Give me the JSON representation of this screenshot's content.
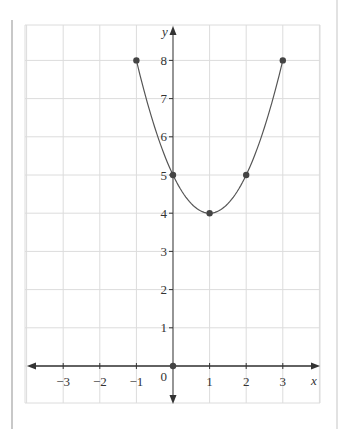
{
  "chart_data": {
    "type": "line",
    "title": "",
    "xlabel": "x",
    "ylabel": "y",
    "xlim": [
      -4,
      4
    ],
    "ylim": [
      -1,
      9
    ],
    "grid": true,
    "x_ticks": [
      -3,
      -2,
      -1,
      1,
      2,
      3
    ],
    "x_tick_labels": [
      "−3",
      "−2",
      "−1",
      "1",
      "2",
      "3"
    ],
    "y_ticks": [
      1,
      2,
      3,
      4,
      5,
      6,
      7,
      8
    ],
    "y_tick_labels": [
      "1",
      "2",
      "3",
      "4",
      "5",
      "6",
      "7",
      "8"
    ],
    "origin_label": "0",
    "series": [
      {
        "name": "y = x² − 2x + 5",
        "kind": "curve",
        "x_range": [
          -1,
          3
        ],
        "x": [
          -1,
          0,
          1,
          2,
          3
        ],
        "y": [
          8,
          5,
          4,
          5,
          8
        ]
      }
    ],
    "points": [
      {
        "x": -1,
        "y": 8
      },
      {
        "x": 0,
        "y": 5
      },
      {
        "x": 1,
        "y": 4
      },
      {
        "x": 2,
        "y": 5
      },
      {
        "x": 3,
        "y": 8
      },
      {
        "x": 0,
        "y": 0
      }
    ],
    "colors": {
      "grid": "#dcdcdc",
      "axis": "#333333",
      "curve": "#555555",
      "point": "#444444"
    }
  }
}
